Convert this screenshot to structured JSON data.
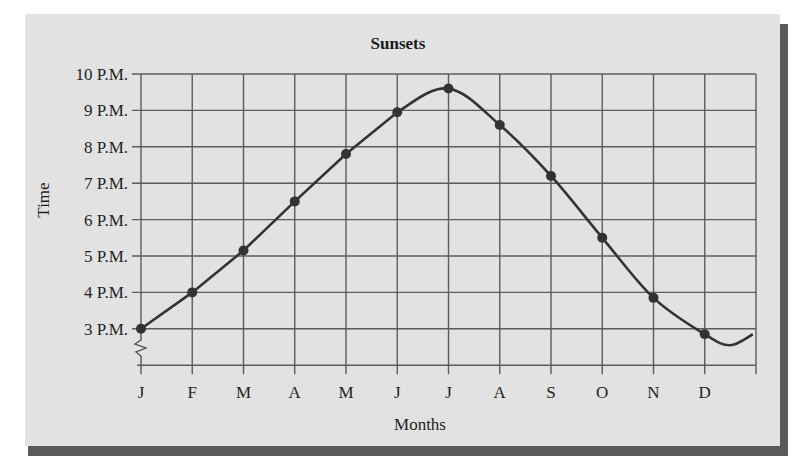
{
  "chart_data": {
    "type": "line",
    "title": "Sunsets",
    "xlabel": "Months",
    "ylabel": "Time",
    "categories": [
      "J",
      "F",
      "M",
      "A",
      "M",
      "J",
      "J",
      "A",
      "S",
      "O",
      "N",
      "D"
    ],
    "y_tick_labels": [
      "10 P.M.",
      "9 P.M.",
      "8 P.M.",
      "7 P.M.",
      "6 P.M.",
      "5 P.M.",
      "4 P.M.",
      "3 P.M."
    ],
    "y_tick_values": [
      10,
      9,
      8,
      7,
      6,
      5,
      4,
      3
    ],
    "series": [
      {
        "name": "Sunset time (P.M. hour)",
        "values": [
          3.0,
          4.0,
          5.15,
          6.5,
          7.8,
          8.95,
          9.6,
          8.6,
          7.2,
          5.5,
          3.85,
          2.85
        ]
      }
    ],
    "ylim": [
      2,
      10
    ],
    "axis_break": "y-axis broken below 3 P.M.",
    "grid": true,
    "legend": "none",
    "colors": {
      "panel": "#e2e2e2",
      "shadow": "#5a5a5a",
      "grid": "#5c5c5c",
      "line": "#333333"
    }
  }
}
